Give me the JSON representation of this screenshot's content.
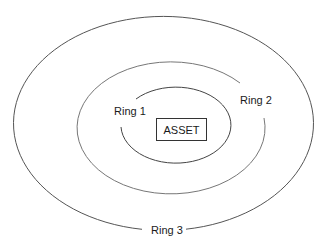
{
  "diagram": {
    "center_label": "ASSET",
    "rings": [
      {
        "id": "ring1",
        "label": "Ring 1"
      },
      {
        "id": "ring2",
        "label": "Ring 2"
      },
      {
        "id": "ring3",
        "label": "Ring 3"
      }
    ],
    "colors": {
      "line": "#555555",
      "text": "#1a1a1a",
      "background": "#ffffff"
    }
  }
}
